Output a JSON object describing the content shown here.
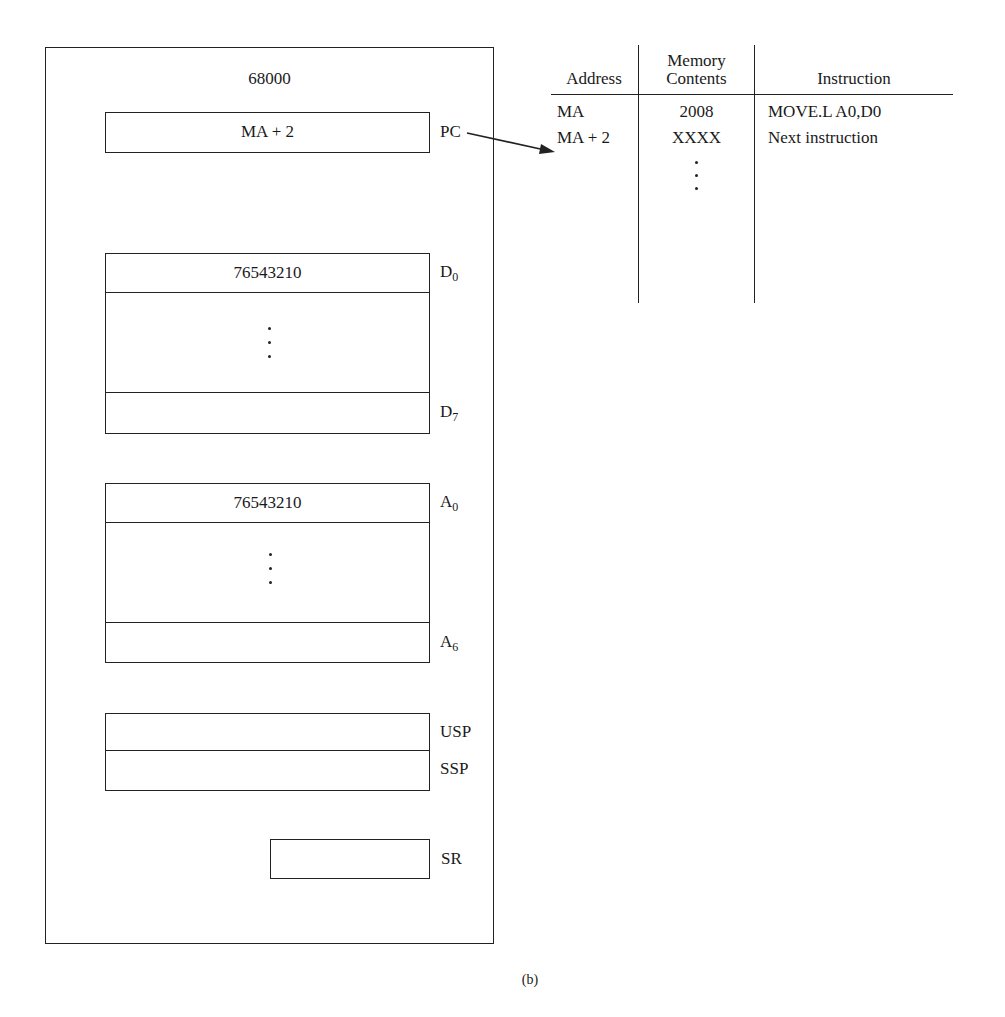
{
  "cpu": {
    "title": "68000",
    "pc": {
      "label": "PC",
      "value": "MA + 2"
    },
    "data_registers": {
      "first": {
        "label_base": "D",
        "label_sub": "0",
        "value": "76543210"
      },
      "last": {
        "label_base": "D",
        "label_sub": "7",
        "value": ""
      }
    },
    "address_registers": {
      "first": {
        "label_base": "A",
        "label_sub": "0",
        "value": "76543210"
      },
      "last": {
        "label_base": "A",
        "label_sub": "6",
        "value": ""
      }
    },
    "stack_pointers": [
      {
        "label": "USP",
        "value": ""
      },
      {
        "label": "SSP",
        "value": ""
      }
    ],
    "status_register": {
      "label": "SR",
      "value": ""
    }
  },
  "memory_table": {
    "headers": {
      "address": "Address",
      "contents_line1": "Memory",
      "contents_line2": "Contents",
      "instruction": "Instruction"
    },
    "rows": [
      {
        "address": "MA",
        "contents": "2008",
        "instruction": "MOVE.L A0,D0"
      },
      {
        "address": "MA + 2",
        "contents": "XXXX",
        "instruction": "Next instruction"
      }
    ]
  },
  "arrow": {
    "from": "PC",
    "to": "MA + 2"
  },
  "caption": "(b)"
}
